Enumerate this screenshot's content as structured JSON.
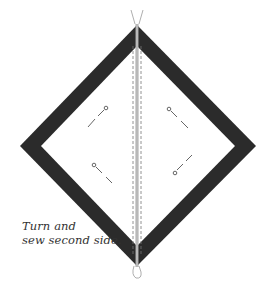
{
  "diagram": {
    "type": "sewing-instruction",
    "caption": {
      "line1": "Turn and",
      "line2": "sew second side."
    },
    "elements": {
      "outer_square": "dark fabric border (on point)",
      "inner_square": "white center",
      "seam": "vertical center seam with stitching lines",
      "pins": 4,
      "thread_tails": [
        "top",
        "bottom"
      ]
    },
    "colors": {
      "border": "#2b2b2b",
      "center": "#ffffff",
      "seam": "#a8a8a8",
      "stitch": "#777777",
      "pin": "#555555"
    }
  }
}
